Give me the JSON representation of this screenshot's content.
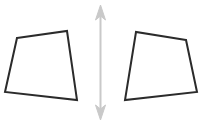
{
  "figure": {
    "title": "Two congruent quadrilaterals reflected across a vertical mirror line",
    "width": 206,
    "height": 125,
    "background_color": "#ffffff",
    "shape_stroke_color": "#2b2b2b",
    "shape_stroke_width": 2,
    "shape_fill_color": "none",
    "arrow_color": "#c9c9c9",
    "arrow_stroke_width": 2,
    "shapes": [
      {
        "name": "left-quadrilateral",
        "label": "left quadrilateral",
        "points": "17,38 67,31 77,100 5,92",
        "vertices": [
          {
            "label": "top-left",
            "x": 17,
            "y": 38
          },
          {
            "label": "top-right",
            "x": 67,
            "y": 31
          },
          {
            "label": "bottom-right",
            "x": 77,
            "y": 100
          },
          {
            "label": "bottom-left",
            "x": 5,
            "y": 92
          }
        ]
      },
      {
        "name": "right-quadrilateral",
        "label": "right quadrilateral",
        "points": "186,40 136,32 125,100 197,92",
        "vertices": [
          {
            "label": "top-right",
            "x": 186,
            "y": 40
          },
          {
            "label": "top-left",
            "x": 136,
            "y": 32
          },
          {
            "label": "bottom-left",
            "x": 125,
            "y": 100
          },
          {
            "label": "bottom-right",
            "x": 197,
            "y": 92
          }
        ]
      }
    ],
    "arrow": {
      "name": "vertical-double-headed-arrow",
      "label": "vertical double-headed arrow",
      "x": 100.5,
      "y_top": 6,
      "y_bottom": 119,
      "shaft_top": "100.5,14",
      "shaft_bottom": "100.5,111",
      "head_top_points": "100.5,5 95.5,20 100.5,16 105.5,20",
      "head_bottom_points": "100.5,120 95.5,105 100.5,109 105.5,105"
    }
  }
}
